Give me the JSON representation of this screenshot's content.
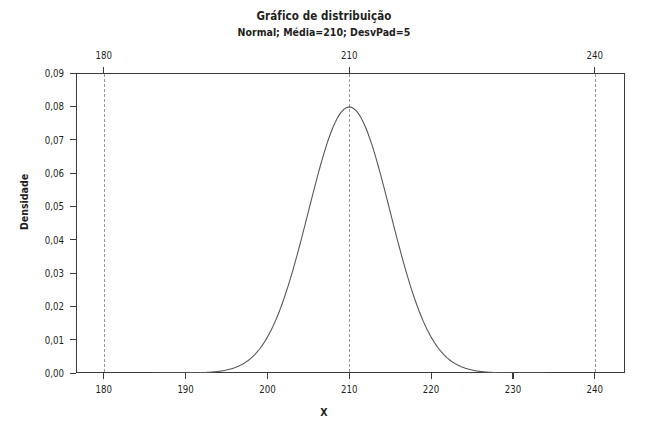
{
  "chart_data": {
    "type": "line",
    "title": "Gráfico de distribuição",
    "subtitle": "Normal; Média=210; DesvPad=5",
    "xlabel": "X",
    "ylabel": "Densidade",
    "distribution": "normal",
    "mean": 210,
    "stdev": 5,
    "peak_value": 0.0798,
    "grid": false,
    "legend": false,
    "xlim": [
      176.6,
      243.7
    ],
    "ylim": [
      0,
      0.09
    ],
    "curve_domain": [
      186,
      234
    ],
    "x_ticks_bottom": [
      "180",
      "190",
      "200",
      "210",
      "220",
      "230",
      "240"
    ],
    "x_tick_values_bottom": [
      180,
      190,
      200,
      210,
      220,
      230,
      240
    ],
    "x_ticks_top": [
      "180",
      "210",
      "240"
    ],
    "x_tick_values_top": [
      180,
      210,
      240
    ],
    "y_ticks": [
      "0,00",
      "0,01",
      "0,02",
      "0,03",
      "0,04",
      "0,05",
      "0,06",
      "0,07",
      "0,08",
      "0,09"
    ],
    "y_tick_values": [
      0.0,
      0.01,
      0.02,
      0.03,
      0.04,
      0.05,
      0.06,
      0.07,
      0.08,
      0.09
    ],
    "reference_lines": [
      180,
      210,
      240
    ],
    "series": [
      {
        "name": "Normal(210,5)",
        "x": [
          186,
          188,
          190,
          192,
          194,
          196,
          198,
          200,
          202,
          204,
          206,
          208,
          210,
          212,
          214,
          216,
          218,
          220,
          222,
          224,
          226,
          228,
          230,
          232,
          234
        ],
        "y": [
          0.00036,
          0.00088,
          0.00175,
          0.00388,
          0.00793,
          0.0148,
          0.0242,
          0.03547,
          0.04839,
          0.06157,
          0.07287,
          0.07978,
          0.07979,
          0.07365,
          0.06157,
          0.04839,
          0.03547,
          0.0242,
          0.0148,
          0.00793,
          0.00388,
          0.00175,
          0.00088,
          0.00036,
          0.00016
        ]
      }
    ],
    "colors": {
      "curve": "#58585b",
      "axis": "#3b3b3f",
      "reference_line": "#9a9a9e",
      "text": "#231f20",
      "background": "#ffffff"
    }
  }
}
